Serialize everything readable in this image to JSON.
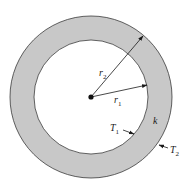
{
  "diagram": {
    "type": "annular-cylinder-cross-section",
    "colors": {
      "background": "#ffffff",
      "ring_fill": "#c8c8c8",
      "stroke": "#3a3a3a",
      "text": "#1a1a1a"
    },
    "geometry": {
      "center": [
        91,
        97
      ],
      "outer_radius": 81,
      "inner_radius": 57
    },
    "labels": {
      "r2": {
        "base": "r",
        "sub": "2"
      },
      "r1": {
        "base": "r",
        "sub": "1"
      },
      "k": {
        "base": "k"
      },
      "T1": {
        "base": "T",
        "sub": "1"
      },
      "T2": {
        "base": "T",
        "sub": "2"
      }
    }
  }
}
